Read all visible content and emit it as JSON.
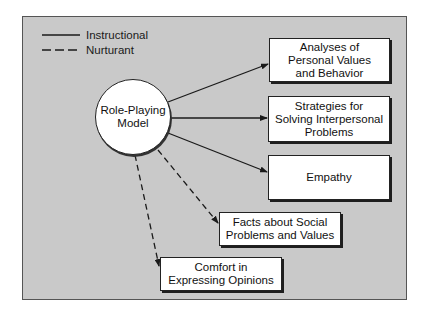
{
  "legend": {
    "items": [
      {
        "label": "Instructional",
        "style": "solid"
      },
      {
        "label": "Nurturant",
        "style": "dashed"
      }
    ]
  },
  "center_node": {
    "label": "Role-Playing\nModel"
  },
  "outcomes": [
    {
      "label": "Analyses of\nPersonal Values\nand Behavior",
      "link": "instructional"
    },
    {
      "label": "Strategies for\nSolving Interpersonal\nProblems",
      "link": "instructional"
    },
    {
      "label": "Empathy",
      "link": "instructional"
    },
    {
      "label": "Facts about Social\nProblems and Values",
      "link": "nurturant"
    },
    {
      "label": "Comfort in\nExpressing Opinions",
      "link": "nurturant"
    }
  ],
  "colors": {
    "background": "#c9c9c9",
    "box_fill": "#ffffff",
    "line": "#1a1a1a"
  }
}
